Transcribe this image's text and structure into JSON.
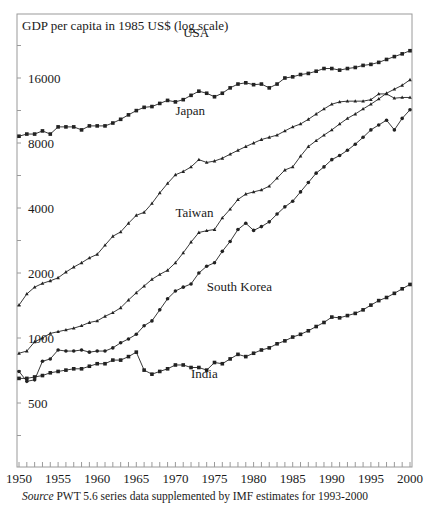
{
  "chart_data": {
    "type": "line",
    "title": "",
    "ylabel": "GDP per capita in 1985 US$ (log scale)",
    "xlabel": "",
    "yscale": "log",
    "ylim": [
      260,
      26000
    ],
    "xlim": [
      1950,
      2000
    ],
    "yticks": [
      500,
      1000,
      2000,
      4000,
      8000,
      16000
    ],
    "xticks": [
      1950,
      1955,
      1960,
      1965,
      1970,
      1975,
      1980,
      1985,
      1990,
      1995,
      2000
    ],
    "grid": false,
    "legend": "inline labels",
    "x": [
      1950,
      1951,
      1952,
      1953,
      1954,
      1955,
      1956,
      1957,
      1958,
      1959,
      1960,
      1961,
      1962,
      1963,
      1964,
      1965,
      1966,
      1967,
      1968,
      1969,
      1970,
      1971,
      1972,
      1973,
      1974,
      1975,
      1976,
      1977,
      1978,
      1979,
      1980,
      1981,
      1982,
      1983,
      1984,
      1985,
      1986,
      1987,
      1988,
      1989,
      1990,
      1991,
      1992,
      1993,
      1994,
      1995,
      1996,
      1997,
      1998,
      1999,
      2000
    ],
    "series": [
      {
        "name": "USA",
        "marker": "square",
        "label_pos": [
          1971,
          32
        ],
        "values": [
          8600,
          8800,
          8800,
          9100,
          8800,
          9500,
          9500,
          9500,
          9200,
          9600,
          9600,
          9600,
          9900,
          10300,
          10800,
          11300,
          11700,
          11800,
          12200,
          12600,
          12400,
          12700,
          13300,
          13900,
          13600,
          13100,
          13600,
          14400,
          15000,
          15200,
          14900,
          15000,
          14400,
          15000,
          16000,
          16200,
          16600,
          16800,
          17200,
          17700,
          17700,
          17400,
          17700,
          17900,
          18300,
          18500,
          18900,
          19500,
          20100,
          20700,
          21400
        ]
      },
      {
        "name": "Japan",
        "marker": "triangle",
        "label_pos": [
          1970,
          110
        ],
        "values": [
          1420,
          1600,
          1720,
          1790,
          1840,
          1900,
          2020,
          2130,
          2230,
          2350,
          2440,
          2690,
          2960,
          3100,
          3400,
          3700,
          3820,
          4200,
          4700,
          5200,
          5700,
          5900,
          6200,
          6700,
          6500,
          6600,
          6800,
          7100,
          7400,
          7700,
          8000,
          8300,
          8500,
          8700,
          9100,
          9500,
          9800,
          10300,
          10900,
          11500,
          12100,
          12400,
          12500,
          12500,
          12500,
          12700,
          13500,
          13500,
          12900,
          13000,
          13000
        ]
      },
      {
        "name": "Taiwan",
        "marker": "triangle",
        "label_pos": [
          1970,
          212
        ],
        "values": [
          850,
          870,
          960,
          1000,
          1050,
          1070,
          1090,
          1110,
          1140,
          1180,
          1200,
          1260,
          1310,
          1380,
          1500,
          1620,
          1740,
          1870,
          1970,
          2060,
          2230,
          2480,
          2780,
          3080,
          3140,
          3180,
          3600,
          3950,
          4380,
          4640,
          4750,
          4850,
          5050,
          5500,
          6000,
          6200,
          6950,
          7700,
          8200,
          8700,
          9200,
          9800,
          10400,
          10900,
          11500,
          12100,
          12800,
          13600,
          14200,
          14800,
          15700
        ]
      },
      {
        "name": "South Korea",
        "marker": "circle",
        "label_pos": [
          1974,
          286
        ],
        "values": [
          700,
          630,
          640,
          780,
          800,
          880,
          870,
          870,
          880,
          860,
          870,
          870,
          900,
          950,
          990,
          1040,
          1140,
          1200,
          1350,
          1520,
          1650,
          1720,
          1780,
          2000,
          2150,
          2230,
          2520,
          2800,
          3180,
          3400,
          3150,
          3280,
          3450,
          3750,
          4050,
          4300,
          4750,
          5250,
          5800,
          6200,
          6700,
          7000,
          7400,
          7900,
          8500,
          9200,
          9700,
          10200,
          9200,
          10400,
          11400
        ]
      },
      {
        "name": "India",
        "marker": "square",
        "label_pos": [
          1972,
          373
        ],
        "values": [
          650,
          650,
          660,
          670,
          690,
          700,
          710,
          720,
          720,
          740,
          760,
          760,
          790,
          790,
          820,
          860,
          710,
          680,
          700,
          720,
          750,
          750,
          730,
          730,
          710,
          770,
          760,
          800,
          840,
          820,
          850,
          880,
          900,
          940,
          970,
          1010,
          1040,
          1080,
          1130,
          1180,
          1250,
          1240,
          1270,
          1300,
          1350,
          1420,
          1490,
          1540,
          1610,
          1690,
          1770
        ]
      }
    ],
    "source_note": "Source PWT 5.6 series data supplemented by IMF estimates for 1993-2000"
  },
  "caption": {
    "source_word": "Source",
    "text": " PWT 5.6 series data supplemented by IMF estimates for 1993-2000"
  },
  "style": {
    "line_color": "#222222",
    "axis_color": "#888888"
  }
}
